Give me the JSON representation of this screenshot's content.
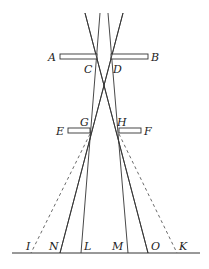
{
  "diagram": {
    "type": "optics-geometric-construction",
    "labels": {
      "A": "A",
      "B": "B",
      "C": "C",
      "D": "D",
      "E": "E",
      "F": "F",
      "G": "G",
      "H": "H",
      "I": "I",
      "N": "N",
      "L": "L",
      "M": "M",
      "O": "O",
      "K": "K"
    },
    "colors": {
      "line": "#333333",
      "background": "#ffffff"
    }
  }
}
